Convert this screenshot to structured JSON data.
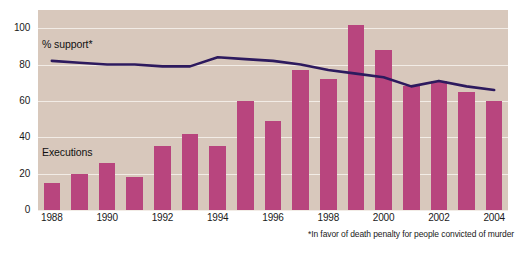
{
  "chart_data": {
    "type": "bar",
    "title": "",
    "subtitle": "",
    "xlabel": "",
    "ylabel": "",
    "ylim": [
      0,
      110
    ],
    "yticks": [
      0,
      20,
      40,
      60,
      80,
      100
    ],
    "ytick_labels": [
      "0",
      "20",
      "40",
      "60",
      "80",
      "100"
    ],
    "grid": true,
    "legend_position": "inline-annotations",
    "categories": [
      "1988",
      "1989",
      "1990",
      "1991",
      "1992",
      "1993",
      "1994",
      "1995",
      "1996",
      "1997",
      "1998",
      "1999",
      "2000",
      "2001",
      "2002",
      "2003",
      "2004"
    ],
    "xtick_labels": [
      "1988",
      "1990",
      "1992",
      "1994",
      "1996",
      "1998",
      "2000",
      "2002",
      "2004"
    ],
    "xtick_categories": [
      "1988",
      "1990",
      "1992",
      "1994",
      "1996",
      "1998",
      "2000",
      "2002",
      "2004"
    ],
    "series": [
      {
        "name": "Executions",
        "type": "bar",
        "color": "#b8457e",
        "values": [
          15,
          20,
          26,
          18,
          35,
          42,
          35,
          60,
          49,
          77,
          72,
          102,
          88,
          68,
          71,
          65,
          60
        ]
      },
      {
        "name": "% support*",
        "type": "line",
        "color": "#2d1a5e",
        "values": [
          82,
          81,
          80,
          80,
          79,
          79,
          84,
          83,
          82,
          80,
          77,
          75,
          73,
          68,
          71,
          68,
          66
        ]
      }
    ],
    "annotations": [
      {
        "id": "support",
        "text": "% support*",
        "x_category": "1988",
        "y": 90
      },
      {
        "id": "executions",
        "text": "Executions",
        "x_category": "1988",
        "y": 33
      }
    ],
    "footnote": "*In favor of death penalty for people convicted of murder",
    "colors": {
      "plot_background": "#d8c8bc",
      "gridline": "#f2ece6",
      "bar": "#b8457e",
      "line": "#2d1a5e",
      "text": "#1a1a1a",
      "page_background": "#ffffff"
    }
  },
  "annotations": {
    "support_label": "% support*",
    "executions_label": "Executions"
  },
  "footnote": {
    "text": "*In favor of death penalty for people convicted of murder"
  }
}
